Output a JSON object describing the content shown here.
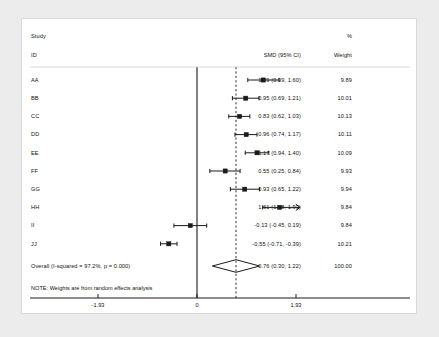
{
  "header": {
    "study_line1": "Study",
    "study_line2": "ID",
    "es_header": "SMD (95% CI)",
    "weight_line1": "%",
    "weight_line2": "Weight"
  },
  "note": "NOTE: Weights are from random effects analysis",
  "colors": {
    "panel_bg": "#ffffff",
    "page_bg": "#ececec",
    "line": "#1a1a1a",
    "text": "#111111",
    "border": "#dadada"
  },
  "chart_data": {
    "type": "forest",
    "title": "",
    "xlabel": "",
    "ylabel": "",
    "effect_measure": "SMD (95% CI)",
    "null_line": 0,
    "summary_line": 0.76,
    "xlim": [
      -2.4,
      2.1
    ],
    "xticks": [
      -1.93,
      0,
      1.93
    ],
    "xticklabels": [
      "-1.93",
      "0",
      "1.93"
    ],
    "grid": false,
    "heterogeneity": "I-squared = 97.2%, p = 0.000",
    "studies": [
      {
        "id": "AA",
        "est": 1.29,
        "lo": 0.99,
        "hi": 1.6,
        "weight": 9.89,
        "label": "1.29 (0.99, 1.60)",
        "weight_label": "9.89",
        "clipped": false
      },
      {
        "id": "BB",
        "est": 0.95,
        "lo": 0.69,
        "hi": 1.21,
        "weight": 10.01,
        "label": "0.95 (0.69, 1.21)",
        "weight_label": "10.01",
        "clipped": false
      },
      {
        "id": "CC",
        "est": 0.83,
        "lo": 0.62,
        "hi": 1.03,
        "weight": 10.13,
        "label": "0.83 (0.62, 1.03)",
        "weight_label": "10.13",
        "clipped": false
      },
      {
        "id": "DD",
        "est": 0.96,
        "lo": 0.74,
        "hi": 1.17,
        "weight": 10.11,
        "label": "0.96 (0.74, 1.17)",
        "weight_label": "10.11",
        "clipped": false
      },
      {
        "id": "EE",
        "est": 1.17,
        "lo": 0.94,
        "hi": 1.4,
        "weight": 10.09,
        "label": "1.17 (0.94, 1.40)",
        "weight_label": "10.09",
        "clipped": false
      },
      {
        "id": "FF",
        "est": 0.55,
        "lo": 0.25,
        "hi": 0.84,
        "weight": 9.93,
        "label": "0.55 (0.25, 0.84)",
        "weight_label": "9.93",
        "clipped": false
      },
      {
        "id": "GG",
        "est": 0.93,
        "lo": 0.65,
        "hi": 1.22,
        "weight": 9.94,
        "label": "0.93 (0.65, 1.22)",
        "weight_label": "9.94",
        "clipped": false
      },
      {
        "id": "HH",
        "est": 1.61,
        "lo": 1.28,
        "hi": 1.93,
        "weight": 9.84,
        "label": "1.61 (1.28, 1.93)",
        "weight_label": "9.84",
        "clipped": true
      },
      {
        "id": "II",
        "est": -0.13,
        "lo": -0.45,
        "hi": 0.19,
        "weight": 9.84,
        "label": "-0.13 (-0.45, 0.19)",
        "weight_label": "9.84",
        "clipped": false
      },
      {
        "id": "JJ",
        "est": -0.55,
        "lo": -0.71,
        "hi": -0.39,
        "weight": 10.21,
        "label": "-0.55 (-0.71, -0.39)",
        "weight_label": "10.21",
        "clipped": false
      }
    ],
    "overall": {
      "id": "Overall  (I-squared = 97.2%, p = 0.000)",
      "est": 0.76,
      "lo": 0.3,
      "hi": 1.22,
      "weight": 100.0,
      "label": "0.76 (0.30, 1.22)",
      "weight_label": "100.00"
    }
  }
}
